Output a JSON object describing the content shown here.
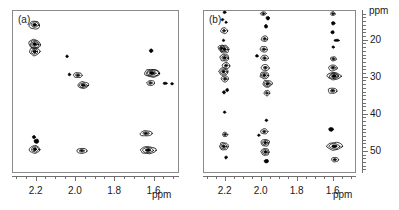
{
  "figure": {
    "type": "2d-nmr-contour-pair",
    "background": "#ffffff",
    "line_color": "#8a8a8a",
    "contour_color": "#000000"
  },
  "panels": [
    {
      "id": "a",
      "label": "(a)",
      "x_axis": {
        "title": "ppm",
        "ticks": [
          "2.2",
          "2.0",
          "1.8",
          "1.6"
        ],
        "range": [
          2.32,
          1.47
        ],
        "direction": "reversed"
      },
      "y_axis": {
        "title": "",
        "ticks": [],
        "range": [
          12,
          56
        ],
        "direction": "reversed",
        "visible": false
      }
    },
    {
      "id": "b",
      "label": "(b)",
      "x_axis": {
        "title": "ppm",
        "ticks": [
          "2.2",
          "2.0",
          "1.8",
          "1.6"
        ],
        "range": [
          2.32,
          1.47
        ],
        "direction": "reversed"
      },
      "y_axis": {
        "title": "ppm",
        "ticks": [
          "20",
          "30",
          "40",
          "50"
        ],
        "range": [
          12,
          56
        ],
        "direction": "reversed",
        "visible": true
      }
    }
  ],
  "chart_data": {
    "type": "scatter",
    "title": "",
    "subtitle": "",
    "xlabel": "ppm",
    "ylabel": "ppm",
    "xlim": [
      2.32,
      1.47
    ],
    "ylim": [
      12,
      56
    ],
    "grid": false,
    "legend": null,
    "series": [
      {
        "name": "panel-a-crosspeaks",
        "panel": "a",
        "points": [
          {
            "x": 2.205,
            "y": 16.0,
            "w": 0.055,
            "h": 2.2,
            "rings": 3
          },
          {
            "x": 2.205,
            "y": 21.2,
            "w": 0.058,
            "h": 2.6,
            "rings": 4
          },
          {
            "x": 2.205,
            "y": 23.2,
            "w": 0.05,
            "h": 2.2,
            "rings": 3
          },
          {
            "x": 2.04,
            "y": 24.5,
            "w": 0.012,
            "h": 0.7,
            "rings": 1
          },
          {
            "x": 2.028,
            "y": 29.4,
            "w": 0.012,
            "h": 0.7,
            "rings": 1
          },
          {
            "x": 1.985,
            "y": 29.6,
            "w": 0.045,
            "h": 1.4,
            "rings": 2
          },
          {
            "x": 1.958,
            "y": 32.3,
            "w": 0.058,
            "h": 1.8,
            "rings": 3
          },
          {
            "x": 1.612,
            "y": 23.0,
            "w": 0.018,
            "h": 0.9,
            "rings": 1
          },
          {
            "x": 1.608,
            "y": 29.0,
            "w": 0.085,
            "h": 2.2,
            "rings": 4
          },
          {
            "x": 1.615,
            "y": 31.7,
            "w": 0.04,
            "h": 1.3,
            "rings": 2
          },
          {
            "x": 1.54,
            "y": 31.8,
            "w": 0.022,
            "h": 0.6,
            "rings": 1
          },
          {
            "x": 1.505,
            "y": 31.9,
            "w": 0.014,
            "h": 0.5,
            "rings": 1
          },
          {
            "x": 2.208,
            "y": 46.3,
            "w": 0.016,
            "h": 0.8,
            "rings": 1
          },
          {
            "x": 2.196,
            "y": 47.4,
            "w": 0.024,
            "h": 1.1,
            "rings": 1
          },
          {
            "x": 2.204,
            "y": 49.6,
            "w": 0.055,
            "h": 2.2,
            "rings": 3
          },
          {
            "x": 1.965,
            "y": 50.0,
            "w": 0.052,
            "h": 1.4,
            "rings": 2
          },
          {
            "x": 1.638,
            "y": 45.3,
            "w": 0.062,
            "h": 1.5,
            "rings": 2
          },
          {
            "x": 1.628,
            "y": 49.8,
            "w": 0.082,
            "h": 2.0,
            "rings": 3
          }
        ]
      },
      {
        "name": "panel-b-crosspeaks",
        "panel": "b",
        "points": [
          {
            "x": 2.2,
            "y": 12.6,
            "w": 0.016,
            "h": 0.7,
            "rings": 1
          },
          {
            "x": 2.212,
            "y": 14.6,
            "w": 0.014,
            "h": 0.6,
            "rings": 1
          },
          {
            "x": 2.192,
            "y": 15.3,
            "w": 0.013,
            "h": 0.6,
            "rings": 1
          },
          {
            "x": 2.203,
            "y": 17.6,
            "w": 0.036,
            "h": 1.5,
            "rings": 2
          },
          {
            "x": 2.206,
            "y": 20.2,
            "w": 0.013,
            "h": 0.6,
            "rings": 1
          },
          {
            "x": 2.2,
            "y": 22.6,
            "w": 0.055,
            "h": 2.1,
            "rings": 3
          },
          {
            "x": 2.218,
            "y": 22.3,
            "w": 0.035,
            "h": 1.6,
            "rings": 2
          },
          {
            "x": 2.2,
            "y": 24.9,
            "w": 0.05,
            "h": 1.9,
            "rings": 3
          },
          {
            "x": 2.192,
            "y": 27.0,
            "w": 0.04,
            "h": 1.7,
            "rings": 2
          },
          {
            "x": 2.206,
            "y": 28.6,
            "w": 0.052,
            "h": 2.0,
            "rings": 3
          },
          {
            "x": 2.198,
            "y": 30.6,
            "w": 0.042,
            "h": 1.6,
            "rings": 2
          },
          {
            "x": 2.186,
            "y": 33.6,
            "w": 0.016,
            "h": 0.8,
            "rings": 1
          },
          {
            "x": 2.204,
            "y": 34.2,
            "w": 0.016,
            "h": 0.8,
            "rings": 1
          },
          {
            "x": 2.2,
            "y": 39.6,
            "w": 0.013,
            "h": 0.6,
            "rings": 1
          },
          {
            "x": 2.198,
            "y": 45.6,
            "w": 0.03,
            "h": 1.2,
            "rings": 2
          },
          {
            "x": 2.205,
            "y": 48.8,
            "w": 0.048,
            "h": 2.1,
            "rings": 3
          },
          {
            "x": 2.192,
            "y": 51.8,
            "w": 0.016,
            "h": 0.7,
            "rings": 1
          },
          {
            "x": 1.985,
            "y": 13.0,
            "w": 0.03,
            "h": 1.0,
            "rings": 2
          },
          {
            "x": 1.96,
            "y": 14.2,
            "w": 0.02,
            "h": 0.9,
            "rings": 1
          },
          {
            "x": 1.97,
            "y": 16.4,
            "w": 0.018,
            "h": 0.9,
            "rings": 1
          },
          {
            "x": 1.978,
            "y": 19.8,
            "w": 0.036,
            "h": 1.5,
            "rings": 2
          },
          {
            "x": 1.982,
            "y": 22.6,
            "w": 0.04,
            "h": 1.6,
            "rings": 2
          },
          {
            "x": 2.02,
            "y": 24.4,
            "w": 0.016,
            "h": 0.7,
            "rings": 1
          },
          {
            "x": 1.978,
            "y": 25.0,
            "w": 0.04,
            "h": 1.5,
            "rings": 2
          },
          {
            "x": 1.974,
            "y": 27.6,
            "w": 0.042,
            "h": 1.6,
            "rings": 2
          },
          {
            "x": 1.98,
            "y": 29.6,
            "w": 0.048,
            "h": 1.8,
            "rings": 3
          },
          {
            "x": 1.962,
            "y": 31.9,
            "w": 0.052,
            "h": 1.9,
            "rings": 3
          },
          {
            "x": 1.965,
            "y": 34.4,
            "w": 0.03,
            "h": 1.4,
            "rings": 2
          },
          {
            "x": 1.968,
            "y": 41.8,
            "w": 0.014,
            "h": 0.6,
            "rings": 1
          },
          {
            "x": 1.98,
            "y": 44.8,
            "w": 0.038,
            "h": 1.4,
            "rings": 2
          },
          {
            "x": 2.01,
            "y": 45.8,
            "w": 0.014,
            "h": 0.6,
            "rings": 1
          },
          {
            "x": 1.974,
            "y": 47.8,
            "w": 0.048,
            "h": 1.8,
            "rings": 3
          },
          {
            "x": 1.974,
            "y": 50.3,
            "w": 0.048,
            "h": 1.9,
            "rings": 3
          },
          {
            "x": 1.968,
            "y": 52.8,
            "w": 0.024,
            "h": 1.0,
            "rings": 1
          },
          {
            "x": 1.598,
            "y": 13.0,
            "w": 0.026,
            "h": 1.0,
            "rings": 2
          },
          {
            "x": 1.596,
            "y": 15.6,
            "w": 0.02,
            "h": 0.9,
            "rings": 1
          },
          {
            "x": 1.6,
            "y": 18.0,
            "w": 0.018,
            "h": 0.8,
            "rings": 1
          },
          {
            "x": 1.578,
            "y": 20.2,
            "w": 0.03,
            "h": 0.5,
            "rings": 1
          },
          {
            "x": 1.596,
            "y": 22.0,
            "w": 0.014,
            "h": 0.6,
            "rings": 1
          },
          {
            "x": 1.596,
            "y": 25.2,
            "w": 0.034,
            "h": 1.2,
            "rings": 2
          },
          {
            "x": 1.598,
            "y": 27.6,
            "w": 0.05,
            "h": 1.6,
            "rings": 2
          },
          {
            "x": 1.592,
            "y": 29.8,
            "w": 0.075,
            "h": 2.1,
            "rings": 4
          },
          {
            "x": 1.6,
            "y": 33.8,
            "w": 0.05,
            "h": 1.6,
            "rings": 2
          },
          {
            "x": 1.608,
            "y": 44.2,
            "w": 0.026,
            "h": 1.0,
            "rings": 1
          },
          {
            "x": 1.59,
            "y": 48.8,
            "w": 0.085,
            "h": 2.2,
            "rings": 3
          },
          {
            "x": 1.588,
            "y": 52.4,
            "w": 0.04,
            "h": 1.2,
            "rings": 2
          }
        ]
      }
    ]
  }
}
